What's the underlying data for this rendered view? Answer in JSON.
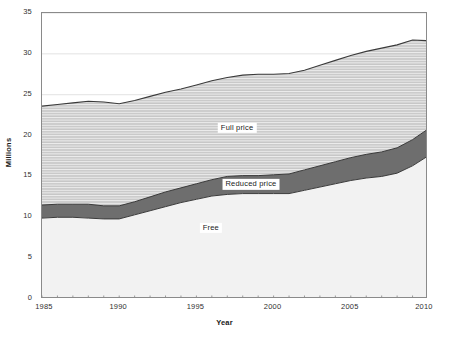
{
  "chart_data": {
    "type": "area",
    "title": "",
    "subtitle": "",
    "xlabel": "Year",
    "ylabel": "Millions",
    "xlim": [
      1985,
      2010
    ],
    "ylim": [
      0,
      35
    ],
    "ytick_labels": [
      "0",
      "5",
      "10",
      "15",
      "20",
      "25",
      "30",
      "35"
    ],
    "yticks": [
      0,
      5,
      10,
      15,
      20,
      25,
      30,
      35
    ],
    "xtick_labels": [
      "1985",
      "1990",
      "1995",
      "2000",
      "2005",
      "2010"
    ],
    "xticks": [
      1985,
      1990,
      1995,
      2000,
      2005,
      2010
    ],
    "x_minor_tick_step": 1,
    "grid": "horizontal-major-faint",
    "legend_position": "inline-annotations",
    "stacked": true,
    "x": [
      1985,
      1986,
      1987,
      1988,
      1989,
      1990,
      1991,
      1992,
      1993,
      1994,
      1995,
      1996,
      1997,
      1998,
      1999,
      2000,
      2001,
      2002,
      2003,
      2004,
      2005,
      2006,
      2007,
      2008,
      2009,
      2010
    ],
    "series": [
      {
        "name": "Free",
        "color": "#f2f2f2",
        "label": "Free",
        "label_x": 1996.0,
        "label_y": 8.6,
        "values": [
          9.9,
          10.0,
          10.0,
          9.9,
          9.8,
          9.8,
          10.3,
          10.8,
          11.3,
          11.8,
          12.2,
          12.6,
          12.8,
          12.9,
          12.9,
          12.9,
          12.9,
          13.3,
          13.7,
          14.1,
          14.5,
          14.8,
          15.0,
          15.4,
          16.3,
          17.5
        ]
      },
      {
        "name": "Reduced price",
        "color": "#6e6e6e",
        "label": "Reduced price",
        "label_x": 1998.6,
        "label_y": 13.9,
        "values": [
          1.6,
          1.6,
          1.6,
          1.7,
          1.6,
          1.6,
          1.6,
          1.7,
          1.8,
          1.8,
          1.9,
          2.0,
          2.2,
          2.2,
          2.2,
          2.3,
          2.4,
          2.5,
          2.6,
          2.7,
          2.8,
          2.9,
          3.0,
          3.1,
          3.2,
          3.3
        ]
      },
      {
        "name": "Full price",
        "color": "#c7c7c7",
        "label": "Full price",
        "label_x": 1997.7,
        "label_y": 20.8,
        "values": [
          12.1,
          12.2,
          12.4,
          12.6,
          12.7,
          12.5,
          12.4,
          12.3,
          12.2,
          12.1,
          12.1,
          12.1,
          12.1,
          12.3,
          12.4,
          12.3,
          12.3,
          12.2,
          12.3,
          12.4,
          12.5,
          12.6,
          12.7,
          12.6,
          12.2,
          10.8
        ]
      }
    ],
    "cumulative_tops": {
      "free": [
        9.9,
        10.0,
        10.0,
        9.9,
        9.8,
        9.8,
        10.3,
        10.8,
        11.3,
        11.8,
        12.2,
        12.6,
        12.8,
        12.9,
        12.9,
        12.9,
        12.9,
        13.3,
        13.7,
        14.1,
        14.5,
        14.8,
        15.0,
        15.4,
        16.3,
        17.5
      ],
      "reduced": [
        11.5,
        11.6,
        11.6,
        11.6,
        11.4,
        11.4,
        11.9,
        12.5,
        13.1,
        13.6,
        14.1,
        14.6,
        15.0,
        15.1,
        15.1,
        15.2,
        15.3,
        15.8,
        16.3,
        16.8,
        17.3,
        17.7,
        18.0,
        18.5,
        19.5,
        20.8
      ],
      "full": [
        23.6,
        23.8,
        24.0,
        24.2,
        24.1,
        23.9,
        24.3,
        24.8,
        25.3,
        25.7,
        26.2,
        26.7,
        27.1,
        27.4,
        27.5,
        27.5,
        27.6,
        28.0,
        28.6,
        29.2,
        29.8,
        30.3,
        30.7,
        31.1,
        31.7,
        31.6
      ]
    }
  },
  "axes": {
    "x_title": "Year",
    "y_title": "Millions"
  }
}
